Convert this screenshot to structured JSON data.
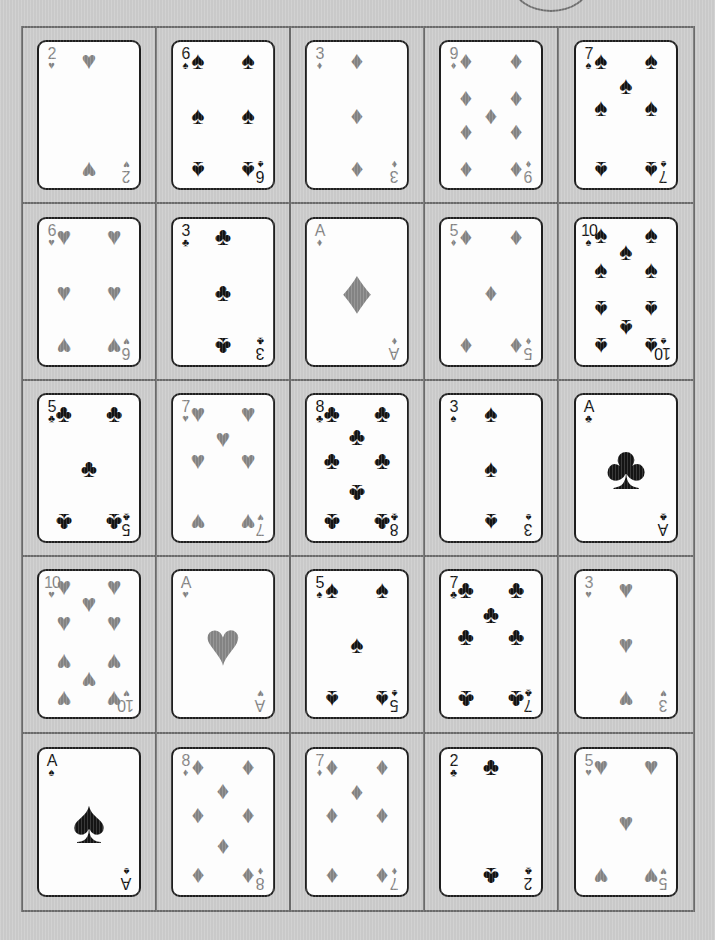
{
  "scene": {
    "title": "Playing Card Grid",
    "background_color": "#c9c9c9",
    "frame_border_color": "#6a6a6a",
    "card_face_color": "#fdfdfd",
    "card_border_color": "#1e1e1e",
    "red_suit_color": "#838383",
    "black_suit_color": "#141414",
    "rows": 5,
    "columns": 5,
    "card_count": 25
  },
  "decor": {
    "top_arc": "partial-circle-outline"
  },
  "suit_glyphs": {
    "hearts": "♥",
    "diamonds": "♦",
    "spades": "♠",
    "clubs": "♣"
  },
  "cards": [
    {
      "rank": "2",
      "suit": "hearts",
      "glyph": "♥",
      "color": "red",
      "label": "2 of Hearts"
    },
    {
      "rank": "6",
      "suit": "spades",
      "glyph": "♠",
      "color": "black",
      "label": "6 of Spades"
    },
    {
      "rank": "3",
      "suit": "diamonds",
      "glyph": "♦",
      "color": "red",
      "label": "3 of Diamonds"
    },
    {
      "rank": "9",
      "suit": "diamonds",
      "glyph": "♦",
      "color": "red",
      "label": "9 of Diamonds"
    },
    {
      "rank": "7",
      "suit": "spades",
      "glyph": "♠",
      "color": "black",
      "label": "7 of Spades"
    },
    {
      "rank": "6",
      "suit": "hearts",
      "glyph": "♥",
      "color": "red",
      "label": "6 of Hearts"
    },
    {
      "rank": "3",
      "suit": "clubs",
      "glyph": "♣",
      "color": "black",
      "label": "3 of Clubs"
    },
    {
      "rank": "A",
      "suit": "diamonds",
      "glyph": "♦",
      "color": "red",
      "label": "Ace of Diamonds"
    },
    {
      "rank": "5",
      "suit": "diamonds",
      "glyph": "♦",
      "color": "red",
      "label": "5 of Diamonds"
    },
    {
      "rank": "10",
      "suit": "spades",
      "glyph": "♠",
      "color": "black",
      "label": "10 of Spades"
    },
    {
      "rank": "5",
      "suit": "clubs",
      "glyph": "♣",
      "color": "black",
      "label": "5 of Clubs"
    },
    {
      "rank": "7",
      "suit": "hearts",
      "glyph": "♥",
      "color": "red",
      "label": "7 of Hearts"
    },
    {
      "rank": "8",
      "suit": "clubs",
      "glyph": "♣",
      "color": "black",
      "label": "8 of Clubs"
    },
    {
      "rank": "3",
      "suit": "spades",
      "glyph": "♠",
      "color": "black",
      "label": "3 of Spades"
    },
    {
      "rank": "A",
      "suit": "clubs",
      "glyph": "♣",
      "color": "black",
      "label": "Ace of Clubs"
    },
    {
      "rank": "10",
      "suit": "hearts",
      "glyph": "♥",
      "color": "red",
      "label": "10 of Hearts"
    },
    {
      "rank": "A",
      "suit": "hearts",
      "glyph": "♥",
      "color": "red",
      "label": "Ace of Hearts"
    },
    {
      "rank": "5",
      "suit": "spades",
      "glyph": "♠",
      "color": "black",
      "label": "5 of Spades"
    },
    {
      "rank": "7",
      "suit": "clubs",
      "glyph": "♣",
      "color": "black",
      "label": "7 of Clubs"
    },
    {
      "rank": "3",
      "suit": "hearts",
      "glyph": "♥",
      "color": "red",
      "label": "3 of Hearts"
    },
    {
      "rank": "A",
      "suit": "spades",
      "glyph": "♠",
      "color": "black",
      "label": "Ace of Spades"
    },
    {
      "rank": "8",
      "suit": "diamonds",
      "glyph": "♦",
      "color": "red",
      "label": "8 of Diamonds"
    },
    {
      "rank": "7",
      "suit": "diamonds",
      "glyph": "♦",
      "color": "red",
      "label": "7 of Diamonds"
    },
    {
      "rank": "2",
      "suit": "clubs",
      "glyph": "♣",
      "color": "black",
      "label": "2 of Clubs"
    },
    {
      "rank": "5",
      "suit": "hearts",
      "glyph": "♥",
      "color": "red",
      "label": "5 of Hearts"
    }
  ],
  "pip_layouts": {
    "A": [
      [
        50,
        50
      ]
    ],
    "2": [
      [
        50,
        8
      ],
      [
        50,
        92
      ]
    ],
    "3": [
      [
        50,
        8
      ],
      [
        50,
        50
      ],
      [
        50,
        92
      ]
    ],
    "5": [
      [
        8,
        8
      ],
      [
        92,
        8
      ],
      [
        50,
        50
      ],
      [
        8,
        92
      ],
      [
        92,
        92
      ]
    ],
    "6": [
      [
        8,
        8
      ],
      [
        92,
        8
      ],
      [
        8,
        50
      ],
      [
        92,
        50
      ],
      [
        8,
        92
      ],
      [
        92,
        92
      ]
    ],
    "7": [
      [
        8,
        8
      ],
      [
        92,
        8
      ],
      [
        8,
        44
      ],
      [
        92,
        44
      ],
      [
        50,
        27
      ],
      [
        8,
        92
      ],
      [
        92,
        92
      ]
    ],
    "8": [
      [
        8,
        8
      ],
      [
        92,
        8
      ],
      [
        8,
        44
      ],
      [
        92,
        44
      ],
      [
        50,
        26
      ],
      [
        50,
        70
      ],
      [
        8,
        92
      ],
      [
        92,
        92
      ]
    ],
    "9": [
      [
        8,
        8
      ],
      [
        92,
        8
      ],
      [
        8,
        36
      ],
      [
        92,
        36
      ],
      [
        50,
        50
      ],
      [
        8,
        64
      ],
      [
        92,
        64
      ],
      [
        8,
        92
      ],
      [
        92,
        92
      ]
    ],
    "10": [
      [
        8,
        6
      ],
      [
        92,
        6
      ],
      [
        8,
        33
      ],
      [
        92,
        33
      ],
      [
        50,
        19
      ],
      [
        8,
        64
      ],
      [
        92,
        64
      ],
      [
        50,
        78
      ],
      [
        8,
        92
      ],
      [
        92,
        92
      ]
    ]
  }
}
